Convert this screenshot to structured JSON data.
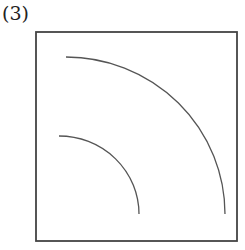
{
  "label": "(3)",
  "figure": {
    "frame": {
      "x": 36,
      "y": 32,
      "width": 201,
      "height": 209,
      "stroke": "#444444"
    },
    "arcs": [
      {
        "name": "outer-arc",
        "start": [
          66,
          57
        ],
        "end": [
          225,
          214
        ],
        "rx": 159,
        "ry": 157
      },
      {
        "name": "inner-arc",
        "start": [
          59,
          136
        ],
        "end": [
          139,
          214
        ],
        "rx": 80,
        "ry": 78
      }
    ],
    "arc_color": "#555555"
  }
}
